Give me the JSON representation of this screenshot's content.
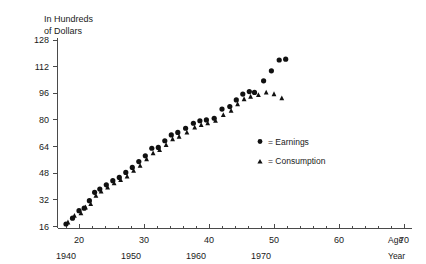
{
  "chart_data": {
    "type": "scatter",
    "title": "",
    "ylabel": "In Hundreds of Dollars",
    "ylabel_line1": "In Hundreds",
    "ylabel_line2": "of Dollars",
    "xlabel_primary": "Age",
    "xlabel_secondary": "Year",
    "ylim": [
      16,
      128
    ],
    "yticks": [
      16,
      32,
      48,
      64,
      80,
      96,
      112,
      128
    ],
    "ytick_labels": [
      "16",
      "32",
      "48",
      "64",
      "80",
      "96",
      "112",
      "128"
    ],
    "xlim": [
      16,
      76
    ],
    "xticks": [
      20,
      30,
      40,
      50,
      60,
      70
    ],
    "xtick_labels": [
      "20",
      "30",
      "40",
      "50",
      "60",
      "70"
    ],
    "xticks_year": [
      18,
      28,
      38,
      48
    ],
    "xtick_year_labels": [
      "1940",
      "1950",
      "1960",
      "1970"
    ],
    "grid": false,
    "legend_position": "center-right",
    "series": [
      {
        "name": "Earnings",
        "marker": "circle",
        "points": [
          [
            18.0,
            17.5
          ],
          [
            19.0,
            21.0
          ],
          [
            20.0,
            25.5
          ],
          [
            20.8,
            27.0
          ],
          [
            21.6,
            31.5
          ],
          [
            22.4,
            36.5
          ],
          [
            23.2,
            38.5
          ],
          [
            24.2,
            41.0
          ],
          [
            25.2,
            43.5
          ],
          [
            26.2,
            45.5
          ],
          [
            27.2,
            48.5
          ],
          [
            28.2,
            51.5
          ],
          [
            29.2,
            55.0
          ],
          [
            30.2,
            58.5
          ],
          [
            31.2,
            63.0
          ],
          [
            32.2,
            63.5
          ],
          [
            33.2,
            67.5
          ],
          [
            34.2,
            71.0
          ],
          [
            35.2,
            72.5
          ],
          [
            36.4,
            75.0
          ],
          [
            37.6,
            78.0
          ],
          [
            38.6,
            79.5
          ],
          [
            39.6,
            80.0
          ],
          [
            40.8,
            81.0
          ],
          [
            42.0,
            86.5
          ],
          [
            43.2,
            88.0
          ],
          [
            44.2,
            92.0
          ],
          [
            45.2,
            95.5
          ],
          [
            46.2,
            97.0
          ],
          [
            47.0,
            96.5
          ],
          [
            48.4,
            103.5
          ],
          [
            49.6,
            109.5
          ],
          [
            50.8,
            116.0
          ],
          [
            51.8,
            116.5
          ]
        ]
      },
      {
        "name": "Consumption",
        "marker": "triangle",
        "points": [
          [
            18.3,
            18.5
          ],
          [
            19.3,
            22.5
          ],
          [
            20.3,
            24.0
          ],
          [
            21.0,
            27.5
          ],
          [
            21.8,
            29.5
          ],
          [
            22.6,
            34.5
          ],
          [
            23.4,
            37.0
          ],
          [
            24.4,
            39.5
          ],
          [
            25.4,
            42.0
          ],
          [
            26.4,
            44.0
          ],
          [
            27.4,
            46.0
          ],
          [
            28.4,
            49.5
          ],
          [
            29.4,
            52.5
          ],
          [
            30.4,
            56.5
          ],
          [
            31.4,
            60.0
          ],
          [
            32.4,
            62.0
          ],
          [
            33.4,
            65.0
          ],
          [
            34.4,
            68.5
          ],
          [
            35.4,
            70.0
          ],
          [
            36.6,
            72.5
          ],
          [
            37.8,
            75.5
          ],
          [
            38.8,
            77.0
          ],
          [
            39.8,
            78.0
          ],
          [
            41.0,
            79.5
          ],
          [
            42.2,
            83.0
          ],
          [
            43.4,
            85.5
          ],
          [
            44.4,
            89.5
          ],
          [
            45.4,
            92.5
          ],
          [
            46.4,
            94.0
          ],
          [
            47.6,
            95.0
          ],
          [
            48.8,
            96.5
          ],
          [
            50.0,
            95.5
          ],
          [
            51.2,
            93.0
          ]
        ]
      }
    ],
    "legend": [
      {
        "marker": "circle",
        "label": "= Earnings"
      },
      {
        "marker": "triangle",
        "label": "= Consumption"
      }
    ]
  }
}
